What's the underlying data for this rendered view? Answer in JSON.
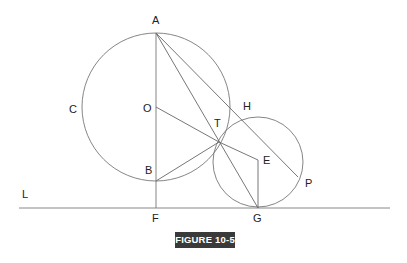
{
  "figure": {
    "caption": "FIGURE 10-5",
    "caption_bg": "#3a3a3a",
    "stroke_color": "#777777"
  },
  "labels": {
    "A": "A",
    "C": "C",
    "O": "O",
    "H": "H",
    "T": "T",
    "B": "B",
    "E": "E",
    "P": "P",
    "L": "L",
    "F": "F",
    "G": "G"
  },
  "geometry": {
    "large_circle": {
      "cx": 156,
      "cy": 107,
      "r": 74
    },
    "small_circle": {
      "cx": 258,
      "cy": 162,
      "r": 46
    },
    "points": {
      "A": [
        156,
        33
      ],
      "O": [
        156,
        107
      ],
      "B": [
        156,
        181
      ],
      "F": [
        156,
        208
      ],
      "T": [
        219,
        142
      ],
      "E": [
        258,
        160
      ],
      "G": [
        258,
        208
      ],
      "P": [
        298,
        176
      ]
    },
    "baseline": {
      "x1": 19,
      "x2": 390,
      "y": 208
    }
  }
}
